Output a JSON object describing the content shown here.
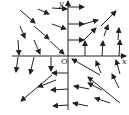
{
  "figure": {
    "type": "direction-field",
    "labels": {
      "y_axis": "y",
      "x_axis": "x",
      "origin": "O"
    },
    "colors": {
      "ink": "#222222",
      "background": "#ffffff"
    },
    "axes": {
      "origin_px": [
        68,
        56
      ],
      "x_axis_from": 12,
      "x_axis_to": 126,
      "y_axis_from": 110,
      "y_axis_to": 1
    }
  },
  "arrows": [
    {
      "from": [
        20,
        10
      ],
      "to": [
        35,
        23
      ]
    },
    {
      "from": [
        38,
        9
      ],
      "to": [
        49,
        14
      ]
    },
    {
      "from": [
        52,
        8
      ],
      "to": [
        67,
        9
      ]
    },
    {
      "from": [
        20,
        26
      ],
      "to": [
        25,
        38
      ]
    },
    {
      "from": [
        34,
        26
      ],
      "to": [
        49,
        39
      ]
    },
    {
      "from": [
        52,
        24
      ],
      "to": [
        66,
        29
      ]
    },
    {
      "from": [
        18,
        40
      ],
      "to": [
        19,
        55
      ]
    },
    {
      "from": [
        34,
        40
      ],
      "to": [
        40,
        54
      ]
    },
    {
      "from": [
        50,
        41
      ],
      "to": [
        64,
        54
      ]
    },
    {
      "from": [
        68,
        7
      ],
      "to": [
        84,
        7
      ]
    },
    {
      "from": [
        68,
        24
      ],
      "to": [
        84,
        24
      ]
    },
    {
      "from": [
        84,
        24
      ],
      "to": [
        98,
        20
      ]
    },
    {
      "from": [
        101,
        26
      ],
      "to": [
        116,
        11
      ]
    },
    {
      "from": [
        68,
        40
      ],
      "to": [
        84,
        40
      ]
    },
    {
      "from": [
        84,
        40
      ],
      "to": [
        96,
        28
      ]
    },
    {
      "from": [
        85,
        56
      ],
      "to": [
        85,
        41
      ]
    },
    {
      "from": [
        102,
        56
      ],
      "to": [
        103,
        41
      ]
    },
    {
      "from": [
        119,
        56
      ],
      "to": [
        120,
        40
      ]
    },
    {
      "from": [
        104,
        36
      ],
      "to": [
        108,
        25
      ]
    },
    {
      "from": [
        118,
        40
      ],
      "to": [
        119,
        28
      ]
    },
    {
      "from": [
        18,
        57
      ],
      "to": [
        16,
        72
      ]
    },
    {
      "from": [
        34,
        57
      ],
      "to": [
        30,
        74
      ]
    },
    {
      "from": [
        51,
        57
      ],
      "to": [
        51,
        71
      ]
    },
    {
      "from": [
        52,
        75
      ],
      "to": [
        21,
        101
      ]
    },
    {
      "from": [
        68,
        73
      ],
      "to": [
        52,
        73
      ]
    },
    {
      "from": [
        56,
        80
      ],
      "to": [
        38,
        87
      ]
    },
    {
      "from": [
        68,
        89
      ],
      "to": [
        51,
        90
      ]
    },
    {
      "from": [
        68,
        105
      ],
      "to": [
        53,
        106
      ]
    },
    {
      "from": [
        100,
        75
      ],
      "to": [
        72,
        59
      ]
    },
    {
      "from": [
        101,
        73
      ],
      "to": [
        96,
        61
      ]
    },
    {
      "from": [
        120,
        74
      ],
      "to": [
        116,
        60
      ]
    },
    {
      "from": [
        102,
        90
      ],
      "to": [
        88,
        83
      ]
    },
    {
      "from": [
        120,
        103
      ],
      "to": [
        88,
        77
      ]
    },
    {
      "from": [
        119,
        88
      ],
      "to": [
        112,
        74
      ]
    },
    {
      "from": [
        89,
        89
      ],
      "to": [
        74,
        86
      ]
    },
    {
      "from": [
        88,
        106
      ],
      "to": [
        73,
        103
      ]
    },
    {
      "from": [
        110,
        103
      ],
      "to": [
        95,
        98
      ]
    }
  ]
}
